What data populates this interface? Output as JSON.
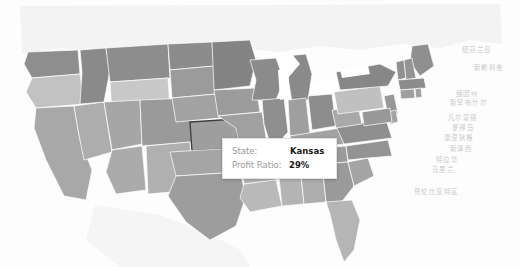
{
  "visualization": {
    "type": "choropleth-map",
    "region": "United States",
    "measure_label": "Profit Ratio",
    "color_scheme": "grayscale",
    "background": "#fdfdfd"
  },
  "tooltip": {
    "state_label": "State:",
    "state_value": "Kansas",
    "ratio_label": "Profit Ratio:",
    "ratio_value": "29%",
    "background": "#ffffff",
    "border_color": "#e2e2e2",
    "key_color": "#9a9a9a",
    "value_color": "#1a1a1a"
  },
  "selection": {
    "highlighted_state": "Kansas",
    "outline_color": "#3d3d3d"
  },
  "geo_labels": [
    {
      "text": "纽芬兰岛",
      "x": 462,
      "y": 44
    },
    {
      "text": "新斯科舍",
      "x": 474,
      "y": 62
    },
    {
      "text": "缅因州",
      "x": 456,
      "y": 88
    },
    {
      "text": "新罕布什尔",
      "x": 450,
      "y": 97
    },
    {
      "text": "凡尔蒙德",
      "x": 448,
      "y": 112
    },
    {
      "text": "罗得岛",
      "x": 452,
      "y": 122
    },
    {
      "text": "康涅狄格",
      "x": 444,
      "y": 132
    },
    {
      "text": "新泽西",
      "x": 450,
      "y": 143
    },
    {
      "text": "特拉华",
      "x": 436,
      "y": 154
    },
    {
      "text": "马里兰",
      "x": 432,
      "y": 164
    },
    {
      "text": "哥伦比亚特区",
      "x": 414,
      "y": 186
    }
  ],
  "state_fills": {
    "WA": "#8e8e8e",
    "OR": "#c2c2c2",
    "CA": "#a8a8a8",
    "NV": "#adadad",
    "ID": "#8a8a8a",
    "MT": "#8d8d8d",
    "WY": "#c8c8c8",
    "UT": "#a6a6a6",
    "AZ": "#ababab",
    "CO": "#9a9a9a",
    "NM": "#b0b0b0",
    "ND": "#8c8c8c",
    "SD": "#9b9b9b",
    "NE": "#a2a2a2",
    "KS": "#9e9e9e",
    "OK": "#a5a5a5",
    "TX": "#9d9d9d",
    "MN": "#848484",
    "IA": "#9c9c9c",
    "MO": "#a0a0a0",
    "AR": "#b6b6b6",
    "LA": "#b9b9b9",
    "WI": "#8b8b8b",
    "IL": "#8f8f8f",
    "MI": "#8a8a8a",
    "IN": "#9f9f9f",
    "OH": "#8d8d8d",
    "KY": "#a3a3a3",
    "TN": "#9b9b9b",
    "MS": "#b4b4b4",
    "AL": "#adadad",
    "GA": "#9a9a9a",
    "FL": "#b5b5b5",
    "SC": "#a4a4a4",
    "NC": "#939393",
    "VA": "#8e8e8e",
    "WV": "#a9a9a9",
    "PA": "#c0c0c0",
    "NY": "#878787",
    "ME": "#8f8f8f",
    "VT": "#9090 90",
    "NH": "#949494",
    "MA": "#8c8c8c",
    "CT": "#9e9e9e",
    "RI": "#a0a0a0",
    "NJ": "#979797",
    "DE": "#a2a2a2",
    "MD": "#9999 99",
    "CANADA": "#f2f2f2",
    "MEXICO": "#f4f4f4",
    "WATER": "#ffffff"
  }
}
